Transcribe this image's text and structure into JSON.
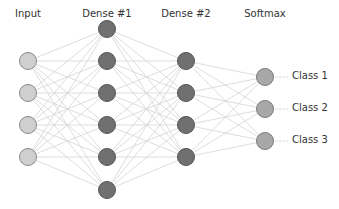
{
  "diagram": {
    "type": "neural-network",
    "layers": [
      {
        "name": "Input",
        "x": 28,
        "nodes_y": [
          61,
          93,
          125,
          157
        ],
        "fill": "#cfcfcf",
        "stroke": "#8a8a8a"
      },
      {
        "name": "Dense #1",
        "x": 107,
        "nodes_y": [
          29,
          61,
          93,
          125,
          157,
          190
        ],
        "fill": "#707070",
        "stroke": "#555555"
      },
      {
        "name": "Dense #2",
        "x": 186,
        "nodes_y": [
          61,
          93,
          125,
          157
        ],
        "fill": "#707070",
        "stroke": "#555555"
      },
      {
        "name": "Softmax",
        "x": 265,
        "nodes_y": [
          77,
          109,
          141
        ],
        "fill": "#a8a8a8",
        "stroke": "#7a7a7a"
      }
    ],
    "outputs": [
      "Class 1",
      "Class 2",
      "Class 3"
    ],
    "edge_color": "#d4d4d4"
  }
}
